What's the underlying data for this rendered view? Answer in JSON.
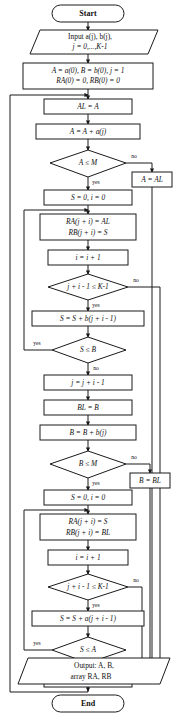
{
  "diagram": {
    "colors": {
      "stroke": "#1a1a1a",
      "fill": "#ffffff",
      "text": "#111111"
    },
    "labels": {
      "yes": "yes",
      "no": "no"
    },
    "nodes": {
      "start": {
        "type": "terminator",
        "text": "Start"
      },
      "input": {
        "type": "io",
        "line1": "Input a(j), b(j),",
        "line2": "j = 0,...,K-1"
      },
      "init": {
        "type": "process",
        "line1": "A = a(0), B = b(0),  j = 1",
        "line2": "RA(0) = 0, RB(0) = 0"
      },
      "al_assign": {
        "type": "process",
        "text": "AL = A"
      },
      "a_accum": {
        "type": "process",
        "text": "A = A + a(j)"
      },
      "a_le_m": {
        "type": "decision",
        "text": "A ≤ M"
      },
      "a_restore": {
        "type": "process",
        "text": "A = AL"
      },
      "s_i_zero_1": {
        "type": "process",
        "text": "S = 0, i = 0"
      },
      "store_1": {
        "type": "process",
        "line1": "RA(j + i) = AL",
        "line2": "RB(j + i) = S"
      },
      "i_inc_1": {
        "type": "process",
        "text": "i = i + 1"
      },
      "bound_1": {
        "type": "decision",
        "text": "j + i - 1 ≤ K-1"
      },
      "s_accum_b": {
        "type": "process",
        "text": "S = S + b(j + i - 1)"
      },
      "s_le_b": {
        "type": "decision",
        "text": "S ≤ B"
      },
      "j_update_1": {
        "type": "process",
        "text": "j = j + i - 1"
      },
      "bl_assign": {
        "type": "process",
        "text": "BL = B"
      },
      "b_accum": {
        "type": "process",
        "text": "B = B + b(j)"
      },
      "b_le_m": {
        "type": "decision",
        "text": "B ≤ M"
      },
      "b_restore": {
        "type": "process",
        "text": "B = BL"
      },
      "s_i_zero_2": {
        "type": "process",
        "text": "S = 0, i = 0"
      },
      "store_2": {
        "type": "process",
        "line1": "RA(j + i) = S",
        "line2": "RB(j + i) = BL"
      },
      "i_inc_2": {
        "type": "process",
        "text": "i = i + 1"
      },
      "bound_2": {
        "type": "decision",
        "text": "j + i - 1 ≤ K-1"
      },
      "s_accum_a": {
        "type": "process",
        "text": "S = S + a(j + i - 1)"
      },
      "s_le_a": {
        "type": "decision",
        "text": "S ≤ A"
      },
      "j_update_2": {
        "type": "process",
        "text": "j = j + i - 1"
      },
      "output": {
        "type": "io",
        "line1": "Output: A, B,",
        "line2": "array RA, RB"
      },
      "end": {
        "type": "terminator",
        "text": "End"
      }
    }
  }
}
